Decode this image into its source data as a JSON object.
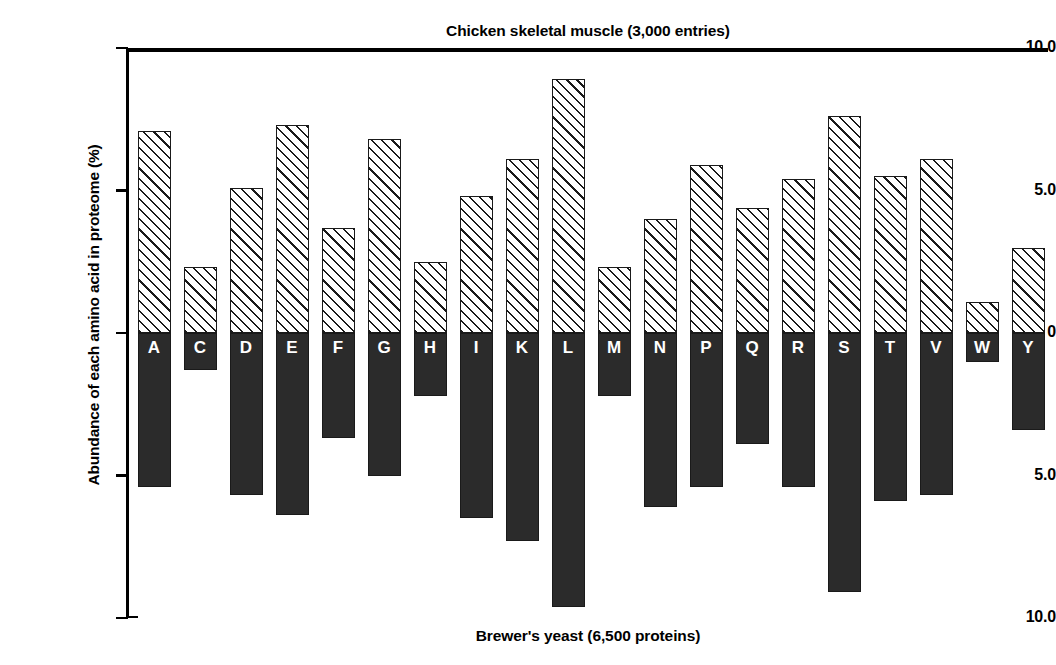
{
  "chart_data": {
    "type": "bar",
    "title": "Chicken skeletal muscle (3,000 entries)",
    "footer": "Brewer's yeast (6,500 proteins)",
    "ylabel": "Abundance of each amino acid in proteome (%)",
    "xlabel": "",
    "orientation": "back-to-back",
    "grid": false,
    "legend": "none",
    "axis_max": 10.0,
    "ytick_labels": [
      "10.0",
      "5.0",
      "0",
      "5.0",
      "10.0"
    ],
    "ytick_values": [
      10.0,
      5.0,
      0,
      -5.0,
      -10.0
    ],
    "categories": [
      "A",
      "C",
      "D",
      "E",
      "F",
      "G",
      "H",
      "I",
      "K",
      "L",
      "M",
      "N",
      "P",
      "Q",
      "R",
      "S",
      "T",
      "V",
      "W",
      "Y"
    ],
    "series": [
      {
        "name": "Chicken skeletal muscle (3,000 entries)",
        "direction": "up",
        "style": "hatched",
        "values": [
          7.1,
          2.3,
          5.1,
          7.3,
          3.7,
          6.8,
          2.5,
          4.8,
          6.1,
          8.9,
          2.3,
          4.0,
          5.9,
          4.4,
          5.4,
          7.6,
          5.5,
          6.1,
          1.1,
          3.0
        ]
      },
      {
        "name": "Brewer's yeast (6,500 proteins)",
        "direction": "down",
        "style": "solid",
        "values": [
          5.4,
          1.3,
          5.7,
          6.4,
          3.7,
          5.0,
          2.2,
          6.5,
          7.3,
          9.6,
          2.2,
          6.1,
          5.4,
          3.9,
          5.4,
          9.1,
          5.9,
          5.7,
          1.0,
          3.4
        ]
      }
    ]
  }
}
